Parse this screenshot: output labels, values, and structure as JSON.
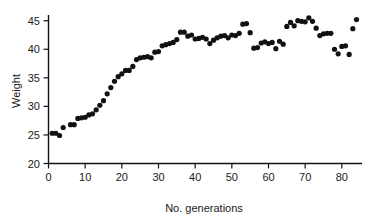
{
  "chart_data": {
    "type": "scatter",
    "title": "",
    "xlabel": "No. generations",
    "ylabel": "Weight",
    "xlim": [
      0,
      85.5
    ],
    "ylim": [
      20,
      46
    ],
    "xticks": [
      0,
      10,
      20,
      30,
      40,
      50,
      60,
      70,
      80
    ],
    "yticks": [
      20,
      25,
      30,
      35,
      40,
      45
    ],
    "xtick_labels": [
      "0",
      "10",
      "20",
      "30",
      "40",
      "50",
      "60",
      "70",
      "80"
    ],
    "ytick_labels": [
      "20",
      "25",
      "30",
      "35",
      "40",
      "45"
    ],
    "grid": false,
    "legend": null,
    "marker": "circle",
    "marker_color": "#111111",
    "marker_size": 2.6,
    "x": [
      1,
      2,
      3,
      4,
      6,
      7,
      8,
      9,
      10,
      11,
      12,
      13,
      14,
      15,
      16,
      17,
      18,
      19,
      20,
      21,
      22,
      23,
      24,
      25,
      26,
      27,
      28,
      29,
      30,
      31,
      32,
      33,
      34,
      35,
      36,
      37,
      38,
      39,
      40,
      41,
      42,
      43,
      44,
      45,
      46,
      47,
      48,
      49,
      50,
      51,
      52,
      53,
      54,
      55,
      56,
      57,
      58,
      59,
      60,
      61,
      62,
      63,
      64,
      65,
      66,
      67,
      68,
      69,
      70,
      71,
      72,
      73,
      74,
      75,
      76,
      77,
      78,
      79,
      80,
      81,
      82,
      83,
      84
    ],
    "y": [
      25.3,
      25.3,
      24.9,
      26.3,
      26.8,
      26.8,
      27.9,
      28.0,
      28.1,
      28.5,
      28.7,
      29.4,
      30.2,
      31.0,
      32.2,
      33.3,
      34.4,
      35.2,
      35.7,
      36.3,
      36.3,
      37.0,
      38.2,
      38.5,
      38.6,
      38.7,
      38.5,
      39.5,
      39.6,
      40.6,
      40.8,
      41.0,
      41.2,
      41.7,
      43.0,
      43.0,
      42.3,
      42.5,
      41.8,
      41.9,
      42.1,
      41.8,
      41.0,
      41.6,
      42.0,
      42.3,
      42.4,
      42.0,
      42.5,
      42.4,
      42.8,
      44.4,
      44.5,
      42.9,
      40.2,
      40.3,
      41.1,
      41.3,
      41.0,
      41.2,
      40.1,
      41.4,
      40.9,
      44.0,
      44.7,
      44.1,
      45.0,
      44.9,
      44.8,
      45.5,
      44.9,
      43.7,
      42.4,
      42.7,
      42.8,
      42.8,
      40.0,
      39.2,
      40.5,
      40.6,
      39.1,
      43.6,
      45.2
    ],
    "n_points": 83
  }
}
